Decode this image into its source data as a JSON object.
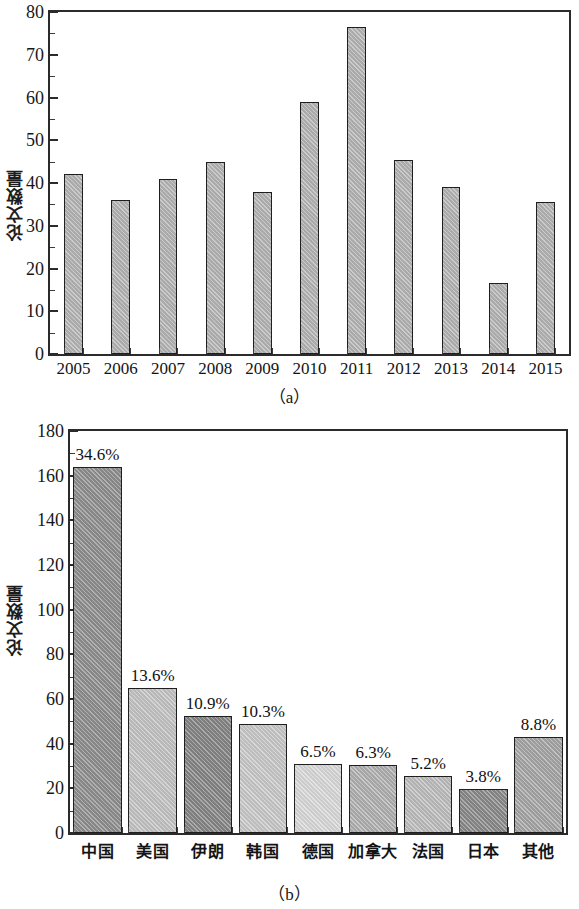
{
  "figure": {
    "panels": [
      {
        "id": "a",
        "caption": "（a）",
        "ylabel": "论文数量"
      },
      {
        "id": "b",
        "caption": "（b）",
        "ylabel": "论文数量"
      }
    ]
  },
  "chart_data": [
    {
      "type": "bar",
      "panel": "a",
      "title": "",
      "xlabel": "",
      "ylabel": "论文数量",
      "categories": [
        "2005",
        "2006",
        "2007",
        "2008",
        "2009",
        "2010",
        "2011",
        "2012",
        "2013",
        "2014",
        "2015"
      ],
      "values": [
        42,
        36,
        41,
        45,
        38,
        59,
        76.5,
        45.5,
        39,
        16.5,
        35.5
      ],
      "ylim": [
        0,
        80
      ],
      "ytick_labels": [
        "0",
        "10",
        "20",
        "30",
        "40",
        "50",
        "60",
        "70",
        "80"
      ],
      "ytick_values": [
        0,
        10,
        20,
        30,
        40,
        50,
        60,
        70,
        80
      ],
      "yminor_step": 5,
      "grid": false,
      "legend": "none",
      "bar_color": "#b5b5b5",
      "bar_edge_color": "#1f1f1f"
    },
    {
      "type": "bar",
      "panel": "b",
      "title": "",
      "xlabel": "",
      "ylabel": "论文数量",
      "categories": [
        "中国",
        "美国",
        "伊朗",
        "韩国",
        "德国",
        "加拿大",
        "法国",
        "日本",
        "其他"
      ],
      "values": [
        164,
        65,
        52.5,
        49,
        31,
        30.5,
        25.5,
        19.5,
        43
      ],
      "data_labels": [
        "34.6%",
        "13.6%",
        "10.9%",
        "10.3%",
        "6.5%",
        "6.3%",
        "5.2%",
        "3.8%",
        "8.8%"
      ],
      "bar_colors": [
        "#8f8f8f",
        "#c3c3c3",
        "#868686",
        "#c9c9c9",
        "#d9d9d9",
        "#b0b0b0",
        "#bdbdbd",
        "#8a8a8a",
        "#a6a6a6"
      ],
      "bar_edge_color": "#1f1f1f",
      "ylim": [
        0,
        180
      ],
      "ytick_labels": [
        "0",
        "20",
        "40",
        "60",
        "80",
        "100",
        "120",
        "140",
        "160",
        "180"
      ],
      "ytick_values": [
        0,
        20,
        40,
        60,
        80,
        100,
        120,
        140,
        160,
        180
      ],
      "yminor_step": 10,
      "grid": false,
      "legend": "none"
    }
  ]
}
